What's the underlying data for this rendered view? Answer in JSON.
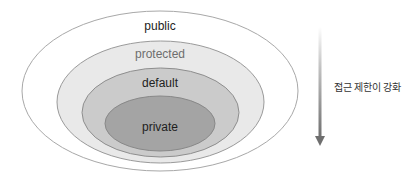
{
  "diagram": {
    "levels": [
      {
        "label": "public",
        "fill": "#ffffff",
        "stroke": "#a8a8a8",
        "text_color": "#222222"
      },
      {
        "label": "protected",
        "fill": "#e9e9e9",
        "stroke": "#9a9a9a",
        "text_color": "#6e6e6e"
      },
      {
        "label": "default",
        "fill": "#cbcbcb",
        "stroke": "#8e8e8e",
        "text_color": "#222222"
      },
      {
        "label": "private",
        "fill": "#a4a4a4",
        "stroke": "#888888",
        "text_color": "#1e1e1e"
      }
    ],
    "arrow": {
      "label": "접근 제한이 강화",
      "direction": "down",
      "color_start": "#ffffff",
      "color_end": "#6f6f6f"
    }
  }
}
